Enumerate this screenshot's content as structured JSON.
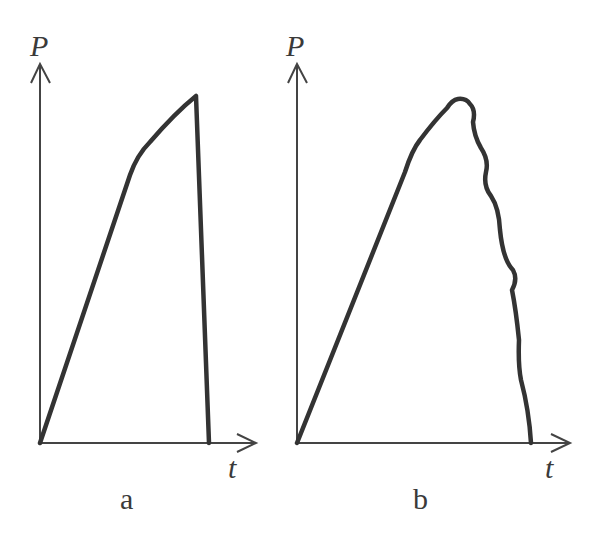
{
  "diagram": {
    "colors": {
      "background": "#ffffff",
      "line": "#333333",
      "axis": "#444444",
      "text": "#3a3a3a"
    },
    "panels": [
      {
        "id": "a",
        "caption": "a",
        "y_axis_label": "P",
        "x_axis_label": "t",
        "curve_shape": "linear rise, concave-down to peak, then near-vertical sudden drop"
      },
      {
        "id": "b",
        "caption": "b",
        "y_axis_label": "P",
        "x_axis_label": "t",
        "curve_shape": "linear rise, rounded peak, then gradual wavy decline to zero"
      }
    ]
  }
}
